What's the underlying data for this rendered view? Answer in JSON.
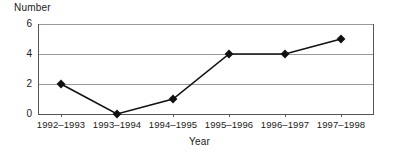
{
  "chart_data": {
    "type": "line",
    "title": "",
    "subtitle": "",
    "xlabel": "Year",
    "ylabel": "Number",
    "categories": [
      "1992–1993",
      "1993–1994",
      "1994–1995",
      "1995–1996",
      "1996–1997",
      "1997–1998"
    ],
    "values": [
      2,
      0,
      1,
      4,
      4,
      5
    ],
    "series": [
      {
        "name": "Number",
        "values": [
          2,
          0,
          1,
          4,
          4,
          5
        ]
      }
    ],
    "ylim": [
      0,
      6
    ],
    "yticks": [
      0,
      2,
      4,
      6
    ],
    "ytick_labels": [
      "0",
      "2",
      "4",
      "6"
    ],
    "grid": true,
    "grid_axis": "y",
    "legend": false,
    "legend_position": "none",
    "marker": "diamond",
    "line_color": "#111111",
    "marker_color": "#111111",
    "grid_color": "#9a9a9a",
    "axis_color": "#555555",
    "background_color": "#ffffff",
    "annotations": []
  }
}
